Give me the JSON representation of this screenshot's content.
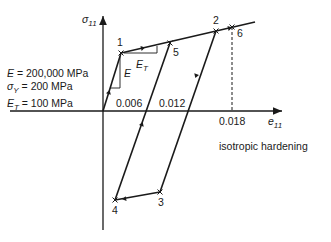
{
  "diagram": {
    "title": "isotropic hardening",
    "axes": {
      "x_label": "e",
      "x_label_sub": "11",
      "y_label": "σ",
      "y_label_sub": "11"
    },
    "parameters": [
      {
        "symbol": "E",
        "sub": "",
        "text": " = 200,000 MPa"
      },
      {
        "symbol": "σ",
        "sub": "Y",
        "text": " = 200 MPa"
      },
      {
        "symbol": "E",
        "sub": "T",
        "text": " = 100 MPa"
      }
    ],
    "tick_labels": [
      "0.006",
      "0.012",
      "0.018"
    ],
    "slope_labels": {
      "elastic": "E",
      "tangent": "E",
      "tangent_sub": "T"
    },
    "points": [
      {
        "id": "1",
        "label": "1"
      },
      {
        "id": "2",
        "label": "2"
      },
      {
        "id": "3",
        "label": "3"
      },
      {
        "id": "4",
        "label": "4"
      },
      {
        "id": "5",
        "label": "5"
      },
      {
        "id": "6",
        "label": "6"
      }
    ],
    "path_order": [
      "0",
      "1",
      "2",
      "3",
      "4",
      "5",
      "6"
    ]
  }
}
